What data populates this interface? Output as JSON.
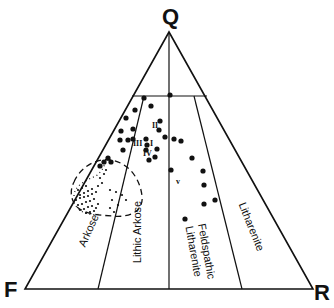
{
  "diagram": {
    "type": "ternary-classification",
    "vertices": {
      "top": {
        "label": "Q",
        "x": 169,
        "y": 32
      },
      "left": {
        "label": "F",
        "x": 25,
        "y": 289
      },
      "right": {
        "label": "R",
        "x": 313,
        "y": 289
      }
    },
    "fields": [
      {
        "id": "arkose",
        "label": "Arkose"
      },
      {
        "id": "lithic-arkose",
        "label": "Lithic Arkose"
      },
      {
        "id": "feldspathic-litharenite",
        "label": "Feldspathic",
        "label2": "Litharenite"
      },
      {
        "id": "litharenite",
        "label": "Litharenite"
      }
    ],
    "group_labels": [
      {
        "label": "I",
        "x": 150,
        "y": 146
      },
      {
        "label": "II",
        "x": 152,
        "y": 128
      },
      {
        "label": "III",
        "x": 133,
        "y": 146
      },
      {
        "label": "IV",
        "x": 143,
        "y": 156
      },
      {
        "label": "v",
        "x": 176,
        "y": 184
      }
    ],
    "line_color": "#111111",
    "point_color": "#111111",
    "large_points": [
      [
        170,
        95
      ],
      [
        144,
        98
      ],
      [
        151,
        106
      ],
      [
        135,
        110
      ],
      [
        126,
        118
      ],
      [
        160,
        121
      ],
      [
        133,
        129
      ],
      [
        159,
        130
      ],
      [
        121,
        131
      ],
      [
        133,
        139
      ],
      [
        146,
        139
      ],
      [
        120,
        140
      ],
      [
        128,
        140
      ],
      [
        165,
        137
      ],
      [
        147,
        145
      ],
      [
        123,
        150
      ],
      [
        146,
        150
      ],
      [
        157,
        149
      ],
      [
        155,
        157
      ],
      [
        149,
        160
      ],
      [
        174,
        139
      ],
      [
        181,
        141
      ],
      [
        192,
        158
      ],
      [
        171,
        170
      ],
      [
        203,
        171
      ],
      [
        204,
        185
      ],
      [
        204,
        204
      ],
      [
        215,
        200
      ],
      [
        185,
        219
      ],
      [
        108,
        158
      ],
      [
        104,
        162
      ],
      [
        111,
        162
      ],
      [
        100,
        166
      ]
    ],
    "small_points": [
      [
        78,
        190
      ],
      [
        82,
        188
      ],
      [
        86,
        186
      ],
      [
        80,
        195
      ],
      [
        84,
        193
      ],
      [
        88,
        191
      ],
      [
        92,
        189
      ],
      [
        76,
        200
      ],
      [
        80,
        198
      ],
      [
        84,
        197
      ],
      [
        88,
        196
      ],
      [
        92,
        194
      ],
      [
        96,
        192
      ],
      [
        78,
        205
      ],
      [
        82,
        204
      ],
      [
        86,
        202
      ],
      [
        90,
        201
      ],
      [
        94,
        199
      ],
      [
        80,
        210
      ],
      [
        84,
        209
      ],
      [
        88,
        207
      ],
      [
        92,
        206
      ],
      [
        86,
        213
      ],
      [
        90,
        212
      ],
      [
        94,
        211
      ],
      [
        98,
        186
      ],
      [
        102,
        183
      ],
      [
        100,
        178
      ],
      [
        104,
        174
      ],
      [
        106,
        170
      ],
      [
        110,
        190
      ],
      [
        116,
        192
      ],
      [
        112,
        200
      ],
      [
        118,
        205
      ],
      [
        122,
        195
      ],
      [
        110,
        208
      ],
      [
        114,
        212
      ],
      [
        126,
        200
      ],
      [
        98,
        204
      ],
      [
        96,
        208
      ]
    ]
  }
}
